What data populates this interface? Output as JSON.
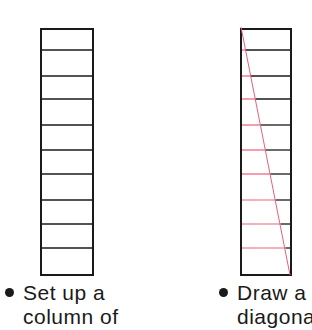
{
  "figures": [
    {
      "id": "left",
      "box": {
        "x": 41,
        "y": 29,
        "w": 52,
        "h": 246
      },
      "rows": 10,
      "line_ys": [
        50,
        76,
        99,
        125,
        150,
        174,
        200,
        224,
        248
      ],
      "diagonal": false,
      "caption": {
        "line1": "Set up a",
        "line2": "column of"
      }
    },
    {
      "id": "right",
      "box": {
        "x": 241,
        "y": 29,
        "w": 50,
        "h": 246
      },
      "rows": 10,
      "line_ys": [
        50,
        76,
        99,
        125,
        150,
        174,
        200,
        224,
        248
      ],
      "diagonal": true,
      "caption": {
        "line1": "Draw a",
        "line2": "diagonal"
      }
    }
  ],
  "colors": {
    "ink": "#1a1a1a",
    "red": "#e8607a"
  }
}
